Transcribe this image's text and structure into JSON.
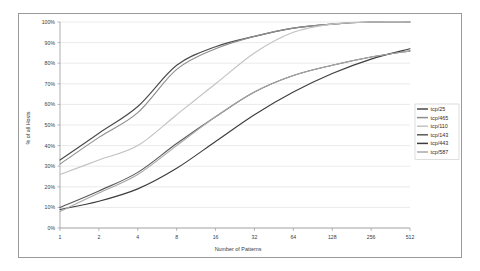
{
  "chart_data": {
    "type": "line",
    "title": "",
    "subtitle": "",
    "xlabel": "Number of Patterns",
    "ylabel": "% of all Hosts",
    "x": [
      1,
      2,
      4,
      8,
      16,
      32,
      64,
      128,
      256,
      512
    ],
    "x_tick_labels": [
      "1",
      "2",
      "4",
      "8",
      "16",
      "32",
      "64",
      "128",
      "256",
      "512"
    ],
    "x_scale": "log2",
    "xlim": [
      1,
      512
    ],
    "y_tick_labels": [
      "0%",
      "10%",
      "20%",
      "30%",
      "40%",
      "50%",
      "60%",
      "70%",
      "80%",
      "90%",
      "100%"
    ],
    "y_ticks": [
      0,
      10,
      20,
      30,
      40,
      50,
      60,
      70,
      80,
      90,
      100
    ],
    "ylim": [
      0,
      100
    ],
    "grid": "horizontal",
    "legend_position": "right",
    "series": [
      {
        "name": "tcp/25",
        "color": "#4a4a4a",
        "values": [
          33,
          46,
          59,
          79,
          88,
          93,
          97,
          99,
          100,
          100
        ]
      },
      {
        "name": "tcp/465",
        "color": "#8e8e8e",
        "values": [
          31,
          44,
          56,
          77,
          87,
          93,
          97,
          99,
          100,
          100
        ]
      },
      {
        "name": "tcp/110",
        "color": "#c2c2c2",
        "values": [
          26,
          33,
          40,
          55,
          70,
          85,
          95,
          99,
          100,
          100
        ]
      },
      {
        "name": "tcp/143",
        "color": "#5a5a5a",
        "values": [
          10,
          18,
          27,
          41,
          54,
          66,
          74,
          79,
          83,
          86
        ]
      },
      {
        "name": "tcp/443",
        "color": "#3d3d3d",
        "values": [
          9,
          13,
          19,
          29,
          42,
          55,
          66,
          75,
          82,
          87
        ]
      },
      {
        "name": "tcp/587",
        "color": "#a8a8a8",
        "values": [
          8,
          17,
          26,
          40,
          54,
          66,
          74,
          79,
          83,
          86
        ]
      }
    ],
    "legend_entries": [
      "tcp/25",
      "tcp/465",
      "tcp/110",
      "tcp/143",
      "tcp/443",
      "tcp/587"
    ],
    "colors": {
      "background": "#ffffff",
      "frame": "#9a9a9a",
      "gridline": "#d4d4d4",
      "axis": "#8c8c8c",
      "text": "#3a3a3a"
    }
  }
}
